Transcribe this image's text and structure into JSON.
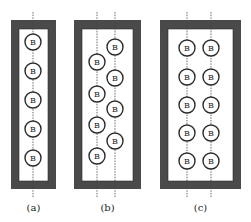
{
  "diagram": {
    "ball_label": "B",
    "colors": {
      "frame": "#4a4a4a",
      "ball_stroke": "#2b2b2b",
      "background": "#ffffff"
    },
    "panels": [
      {
        "caption": "(a)",
        "frame": {
          "x": 11,
          "y": 20,
          "w": 45,
          "h": 169,
          "wall": 8
        },
        "axes_x": [
          33
        ],
        "balls": [
          [
            33,
            42
          ],
          [
            33,
            71
          ],
          [
            33,
            100
          ],
          [
            33,
            129
          ],
          [
            33,
            158
          ]
        ]
      },
      {
        "caption": "(b)",
        "frame": {
          "x": 74,
          "y": 20,
          "w": 67,
          "h": 169,
          "wall": 8
        },
        "axes_x": [
          97,
          115
        ],
        "balls": [
          [
            115,
            47
          ],
          [
            97,
            62
          ],
          [
            115,
            78
          ],
          [
            97,
            94
          ],
          [
            115,
            109
          ],
          [
            97,
            125
          ],
          [
            115,
            141
          ],
          [
            97,
            156
          ]
        ]
      },
      {
        "caption": "(c)",
        "frame": {
          "x": 160,
          "y": 20,
          "w": 81,
          "h": 169,
          "wall": 8
        },
        "axes_x": [
          187,
          211
        ],
        "balls": [
          [
            187,
            48
          ],
          [
            211,
            48
          ],
          [
            187,
            77
          ],
          [
            211,
            77
          ],
          [
            187,
            105
          ],
          [
            211,
            105
          ],
          [
            187,
            133
          ],
          [
            211,
            133
          ],
          [
            187,
            161
          ],
          [
            211,
            161
          ]
        ]
      }
    ]
  }
}
